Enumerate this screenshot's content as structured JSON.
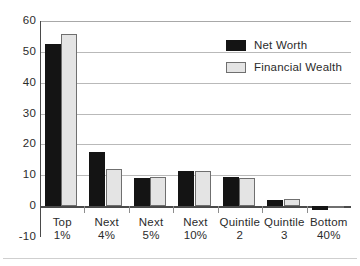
{
  "chart_data": {
    "type": "bar",
    "title": "",
    "subtitle": "",
    "xlabel": "",
    "ylabel": "",
    "categories": [
      {
        "line1": "Top",
        "line2": "1%"
      },
      {
        "line1": "Next",
        "line2": "4%"
      },
      {
        "line1": "Next",
        "line2": "5%"
      },
      {
        "line1": "Next",
        "line2": "10%"
      },
      {
        "line1": "Quintile",
        "line2": "2"
      },
      {
        "line1": "Quintile",
        "line2": "3"
      },
      {
        "line1": "Bottom",
        "line2": "40%"
      }
    ],
    "series": [
      {
        "name": "Net Worth",
        "color": "#141414",
        "values": [
          52.5,
          17.5,
          9.2,
          11.3,
          9.5,
          2.0,
          -1.4
        ]
      },
      {
        "name": "Financial Wealth",
        "color": "#e4e4e4",
        "values": [
          55.8,
          12.0,
          9.3,
          11.5,
          9.0,
          2.4,
          0.2
        ]
      }
    ],
    "ylim": [
      -10,
      60
    ],
    "yticks": [
      60,
      50,
      40,
      30,
      20,
      10,
      0,
      -10
    ],
    "ytick_labels": [
      "60",
      "50",
      "40",
      "30",
      "20",
      "10",
      "0",
      "-10"
    ],
    "grid": "horizontal",
    "legend_position": "upper-right"
  }
}
